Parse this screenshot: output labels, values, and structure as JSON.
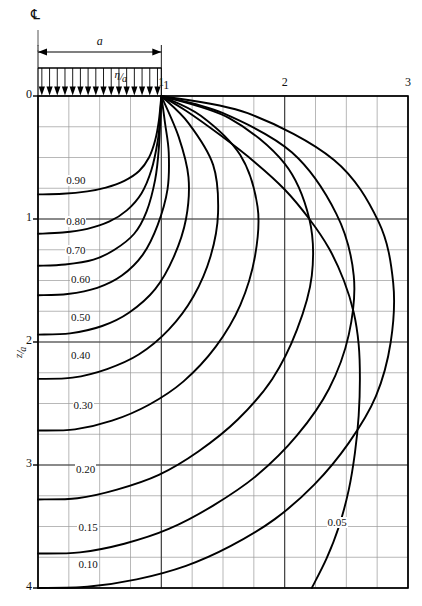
{
  "figure": {
    "kind": "stress-isobar-pressure-bulb-chart",
    "centerline_symbol": "℄",
    "load_width_label": "a",
    "arrow_count": 16
  },
  "axes": {
    "x": {
      "name_numerator": "η",
      "name_denominator": "a",
      "name_plain": "η/a",
      "position": "top",
      "min": 0,
      "max": 3,
      "tick_labels": [
        "0",
        "1",
        "2",
        "3"
      ],
      "tick_values": [
        0,
        1,
        2,
        3
      ],
      "minor_step": 0.25
    },
    "y": {
      "name_numerator": "z",
      "name_denominator": "a",
      "name_plain": "z/a",
      "position": "left",
      "min": 0,
      "max": 4,
      "tick_labels": [
        "0",
        "1",
        "2",
        "3",
        "4"
      ],
      "tick_values": [
        0,
        1,
        2,
        3,
        4
      ],
      "minor_step": 0.25,
      "direction": "downward"
    },
    "grid": "on",
    "grid_color": "#9a9a9a",
    "frame_color": "#000000"
  },
  "chart_data": {
    "type": "line",
    "title": "",
    "subtitle": "",
    "xlabel": "η/a",
    "ylabel": "z/a",
    "xlim": [
      0,
      3
    ],
    "ylim": [
      0,
      4
    ],
    "grid": true,
    "legend": "inline-labels",
    "y_axis_inverted": true,
    "annotations": [
      {
        "text": "℀",
        "role": "centerline-symbol"
      },
      {
        "text": "a",
        "role": "load-width-dimension"
      },
      {
        "text": "1",
        "role": "load-edge-marker"
      }
    ],
    "series": [
      {
        "name": "0.90",
        "label": "0.90",
        "label_at": {
          "x": 0.22,
          "y": 0.7
        },
        "points": [
          [
            0.0,
            0.8
          ],
          [
            0.2,
            0.795
          ],
          [
            0.4,
            0.775
          ],
          [
            0.55,
            0.745
          ],
          [
            0.7,
            0.69
          ],
          [
            0.82,
            0.61
          ],
          [
            0.9,
            0.5
          ],
          [
            0.95,
            0.36
          ],
          [
            0.98,
            0.2
          ],
          [
            1.0,
            0.0
          ]
        ]
      },
      {
        "name": "0.80",
        "label": "0.80",
        "label_at": {
          "x": 0.22,
          "y": 1.03
        },
        "points": [
          [
            0.0,
            1.12
          ],
          [
            0.2,
            1.11
          ],
          [
            0.4,
            1.08
          ],
          [
            0.58,
            1.02
          ],
          [
            0.72,
            0.93
          ],
          [
            0.84,
            0.79
          ],
          [
            0.92,
            0.6
          ],
          [
            0.97,
            0.37
          ],
          [
            0.99,
            0.18
          ],
          [
            1.0,
            0.0
          ]
        ]
      },
      {
        "name": "0.70",
        "label": "0.70",
        "label_at": {
          "x": 0.22,
          "y": 1.27
        },
        "points": [
          [
            0.0,
            1.38
          ],
          [
            0.22,
            1.37
          ],
          [
            0.45,
            1.33
          ],
          [
            0.62,
            1.25
          ],
          [
            0.78,
            1.12
          ],
          [
            0.88,
            0.94
          ],
          [
            0.95,
            0.68
          ],
          [
            0.98,
            0.42
          ],
          [
            1.0,
            0.0
          ]
        ]
      },
      {
        "name": "0.60",
        "label": "0.60",
        "label_at": {
          "x": 0.26,
          "y": 1.5
        },
        "points": [
          [
            0.0,
            1.62
          ],
          [
            0.24,
            1.61
          ],
          [
            0.48,
            1.56
          ],
          [
            0.68,
            1.46
          ],
          [
            0.85,
            1.29
          ],
          [
            0.97,
            1.05
          ],
          [
            1.05,
            0.76
          ],
          [
            1.06,
            0.46
          ],
          [
            1.03,
            0.22
          ],
          [
            1.0,
            0.0
          ]
        ]
      },
      {
        "name": "0.50",
        "label": "0.50",
        "label_at": {
          "x": 0.26,
          "y": 1.81
        },
        "points": [
          [
            0.0,
            1.94
          ],
          [
            0.26,
            1.93
          ],
          [
            0.52,
            1.87
          ],
          [
            0.74,
            1.76
          ],
          [
            0.95,
            1.57
          ],
          [
            1.1,
            1.31
          ],
          [
            1.2,
            1.0
          ],
          [
            1.22,
            0.66
          ],
          [
            1.14,
            0.33
          ],
          [
            1.0,
            0.0
          ]
        ]
      },
      {
        "name": "0.40",
        "label": "0.40",
        "label_at": {
          "x": 0.26,
          "y": 2.12
        },
        "points": [
          [
            0.0,
            2.3
          ],
          [
            0.28,
            2.29
          ],
          [
            0.56,
            2.22
          ],
          [
            0.82,
            2.1
          ],
          [
            1.06,
            1.9
          ],
          [
            1.26,
            1.63
          ],
          [
            1.4,
            1.3
          ],
          [
            1.46,
            0.95
          ],
          [
            1.42,
            0.56
          ],
          [
            1.22,
            0.22
          ],
          [
            1.0,
            0.0
          ]
        ]
      },
      {
        "name": "0.30",
        "label": "0.30",
        "label_at": {
          "x": 0.28,
          "y": 2.53
        },
        "points": [
          [
            0.0,
            2.72
          ],
          [
            0.3,
            2.71
          ],
          [
            0.6,
            2.64
          ],
          [
            0.9,
            2.51
          ],
          [
            1.18,
            2.32
          ],
          [
            1.44,
            2.04
          ],
          [
            1.64,
            1.7
          ],
          [
            1.76,
            1.3
          ],
          [
            1.78,
            0.9
          ],
          [
            1.64,
            0.48
          ],
          [
            1.32,
            0.16
          ],
          [
            1.0,
            0.0
          ]
        ]
      },
      {
        "name": "0.20",
        "label": "0.20",
        "label_at": {
          "x": 0.3,
          "y": 3.05
        },
        "points": [
          [
            0.0,
            3.28
          ],
          [
            0.32,
            3.27
          ],
          [
            0.64,
            3.2
          ],
          [
            0.98,
            3.08
          ],
          [
            1.3,
            2.89
          ],
          [
            1.62,
            2.63
          ],
          [
            1.9,
            2.3
          ],
          [
            2.1,
            1.9
          ],
          [
            2.22,
            1.46
          ],
          [
            2.2,
            1.0
          ],
          [
            2.0,
            0.55
          ],
          [
            1.55,
            0.18
          ],
          [
            1.0,
            0.0
          ]
        ]
      },
      {
        "name": "0.15",
        "label": "0.15",
        "label_at": {
          "x": 0.32,
          "y": 3.52
        },
        "points": [
          [
            0.0,
            3.72
          ],
          [
            0.34,
            3.71
          ],
          [
            0.7,
            3.64
          ],
          [
            1.06,
            3.52
          ],
          [
            1.42,
            3.33
          ],
          [
            1.78,
            3.08
          ],
          [
            2.1,
            2.76
          ],
          [
            2.36,
            2.38
          ],
          [
            2.52,
            1.94
          ],
          [
            2.56,
            1.46
          ],
          [
            2.42,
            0.96
          ],
          [
            2.06,
            0.46
          ],
          [
            1.5,
            0.14
          ],
          [
            1.0,
            0.0
          ]
        ]
      },
      {
        "name": "0.10",
        "label": "0.10",
        "label_at": {
          "x": 0.32,
          "y": 3.82
        },
        "points": [
          [
            0.0,
            4.0
          ],
          [
            0.4,
            3.99
          ],
          [
            0.8,
            3.93
          ],
          [
            1.2,
            3.82
          ],
          [
            1.56,
            3.66
          ],
          [
            1.92,
            3.44
          ],
          [
            2.24,
            3.16
          ],
          [
            2.52,
            2.82
          ],
          [
            2.74,
            2.44
          ],
          [
            2.86,
            2.0
          ],
          [
            2.88,
            1.52
          ],
          [
            2.76,
            1.02
          ],
          [
            2.4,
            0.52
          ],
          [
            1.7,
            0.14
          ],
          [
            1.0,
            0.0
          ]
        ]
      },
      {
        "name": "0.05",
        "label": "0.05",
        "label_at": {
          "x": 2.34,
          "y": 3.48
        },
        "points": [
          [
            2.22,
            4.0
          ],
          [
            2.34,
            3.76
          ],
          [
            2.44,
            3.5
          ],
          [
            2.52,
            3.2
          ],
          [
            2.57,
            2.9
          ],
          [
            2.6,
            2.6
          ],
          [
            2.61,
            2.3
          ],
          [
            2.6,
            2.02
          ],
          [
            2.56,
            1.76
          ],
          [
            2.48,
            1.5
          ],
          [
            2.36,
            1.24
          ],
          [
            2.2,
            1.0
          ],
          [
            2.0,
            0.76
          ],
          [
            1.76,
            0.54
          ],
          [
            1.48,
            0.32
          ],
          [
            1.2,
            0.12
          ],
          [
            1.0,
            0.0
          ]
        ]
      }
    ]
  }
}
